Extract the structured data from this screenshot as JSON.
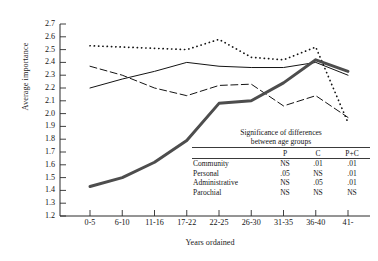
{
  "chart_data": {
    "type": "line",
    "title": "",
    "xlabel": "Years ordained",
    "ylabel": "Average importance",
    "categories": [
      "0-5",
      "6-10",
      "11-16",
      "17-22",
      "22-25",
      "26-30",
      "31-35",
      "36-40",
      "41-"
    ],
    "ylim": [
      1.2,
      2.7
    ],
    "ytick_labels": [
      "2.7",
      "2.6",
      "2.5",
      "2.4",
      "2.3",
      "2.2",
      "2.1",
      "2.0",
      "1.9",
      "1.8",
      "1.7",
      "1.6",
      "1.5",
      "1.4",
      "1.3",
      "1.2"
    ],
    "ytick_values": [
      2.7,
      2.6,
      2.5,
      2.4,
      2.3,
      2.2,
      2.1,
      2.0,
      1.9,
      1.8,
      1.7,
      1.6,
      1.5,
      1.4,
      1.3,
      1.2
    ],
    "grid": false,
    "legend": "none",
    "series": [
      {
        "name": "Community",
        "style": "dotted",
        "color": "#141414",
        "values": [
          2.53,
          2.52,
          2.51,
          2.5,
          2.58,
          2.44,
          2.42,
          2.52,
          1.93
        ]
      },
      {
        "name": "Personal",
        "style": "solid-thin",
        "color": "#141414",
        "values": [
          2.2,
          2.27,
          2.33,
          2.4,
          2.37,
          2.36,
          2.36,
          2.4,
          2.3
        ]
      },
      {
        "name": "Administrative",
        "style": "dashed",
        "color": "#141414",
        "values": [
          2.37,
          2.3,
          2.2,
          2.14,
          2.22,
          2.23,
          2.06,
          2.14,
          1.97
        ]
      },
      {
        "name": "Parochial",
        "style": "solid-thick",
        "color": "#4d4d4d",
        "values": [
          1.43,
          1.5,
          1.62,
          1.79,
          2.08,
          2.1,
          2.24,
          2.42,
          2.33
        ]
      }
    ]
  },
  "sig_table": {
    "caption_line1": "Significance of differences",
    "caption_line2": "between age groups",
    "columns": [
      "",
      "P",
      "C",
      "P+C"
    ],
    "rows": [
      {
        "label": "Community",
        "P": "NS",
        "C": ".01",
        "PC": ".01"
      },
      {
        "label": "Personal",
        "P": ".05",
        "C": "NS",
        "PC": ".01"
      },
      {
        "label": "Administrative",
        "P": "NS",
        "C": ".05",
        "PC": ".01"
      },
      {
        "label": "Parochial",
        "P": "NS",
        "C": "NS",
        "PC": "NS"
      }
    ]
  }
}
